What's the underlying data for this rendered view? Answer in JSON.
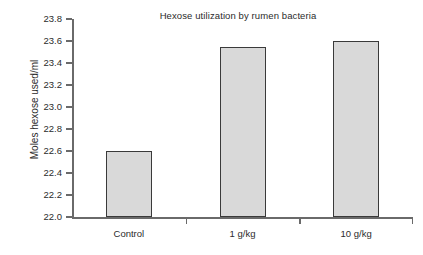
{
  "chart_data": {
    "type": "bar",
    "title": "Hexose utilization by rumen bacteria",
    "xlabel": "",
    "ylabel": "Moles hexose used/ml",
    "categories": [
      "Control",
      "1 g/kg",
      "10 g/kg"
    ],
    "values": [
      22.6,
      23.55,
      23.6
    ],
    "ylim": [
      22.0,
      23.8
    ],
    "ytick_labels": [
      "23.8",
      "23.6",
      "23.4",
      "23.2",
      "23.0",
      "22.8",
      "22.6",
      "22.4",
      "22.2",
      "22.0"
    ],
    "ytick_values": [
      23.8,
      23.6,
      23.4,
      23.2,
      23.0,
      22.8,
      22.6,
      22.4,
      22.2,
      22.0
    ],
    "grid": false,
    "legend": null,
    "legend_position": "none",
    "bar_fill_color": "#d9d9d9",
    "bar_border_color": "#3a3a3a",
    "axis_color": "#6a6a6a",
    "background_color": "#ffffff",
    "text_color": "#2b2b2b"
  }
}
